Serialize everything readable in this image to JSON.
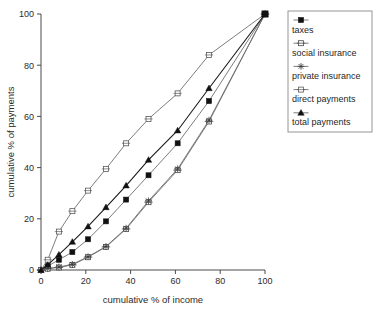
{
  "chart_data": {
    "type": "line",
    "title": "",
    "xlabel": "cumulative % of income",
    "ylabel": "cumulative % of payments",
    "xlim": [
      0,
      100
    ],
    "ylim": [
      0,
      100
    ],
    "xticks": [
      0,
      20,
      40,
      60,
      80,
      100
    ],
    "yticks": [
      0,
      20,
      40,
      60,
      80,
      100
    ],
    "grid": false,
    "legend_position": "right",
    "x": [
      0,
      3,
      8,
      14,
      21,
      29,
      38,
      48,
      61,
      75,
      100
    ],
    "series": [
      {
        "name": "taxes",
        "marker": "filled-square",
        "values": [
          0,
          1.5,
          4,
          7,
          12,
          19,
          27.5,
          37,
          49.5,
          66,
          100
        ]
      },
      {
        "name": "social insurance",
        "marker": "open-square-crossed",
        "values": [
          0,
          0.5,
          1,
          2,
          5,
          9,
          16,
          26.5,
          39,
          58,
          100
        ]
      },
      {
        "name": "private insurance",
        "marker": "star",
        "values": [
          0,
          0.6,
          1.2,
          2.2,
          5.2,
          9.2,
          16.3,
          27,
          39.5,
          58.5,
          100
        ]
      },
      {
        "name": "direct payments",
        "marker": "open-square",
        "values": [
          0,
          4,
          15,
          23,
          31,
          39.5,
          49.5,
          59,
          69,
          84,
          100
        ]
      },
      {
        "name": "total payments",
        "marker": "filled-triangle",
        "values": [
          0,
          2,
          6,
          11,
          17,
          24.5,
          33,
          43,
          54.5,
          71,
          100
        ]
      }
    ]
  },
  "legend": {
    "items": [
      {
        "label": "taxes"
      },
      {
        "label": "social insurance"
      },
      {
        "label": "private insurance"
      },
      {
        "label": "direct payments"
      },
      {
        "label": "total payments"
      }
    ]
  },
  "colors": {
    "line": "#6e6e6e",
    "line_dark": "#1a1a1a",
    "axis": "#4a4a4a",
    "text": "#2b2b2b",
    "background": "#ffffff"
  }
}
